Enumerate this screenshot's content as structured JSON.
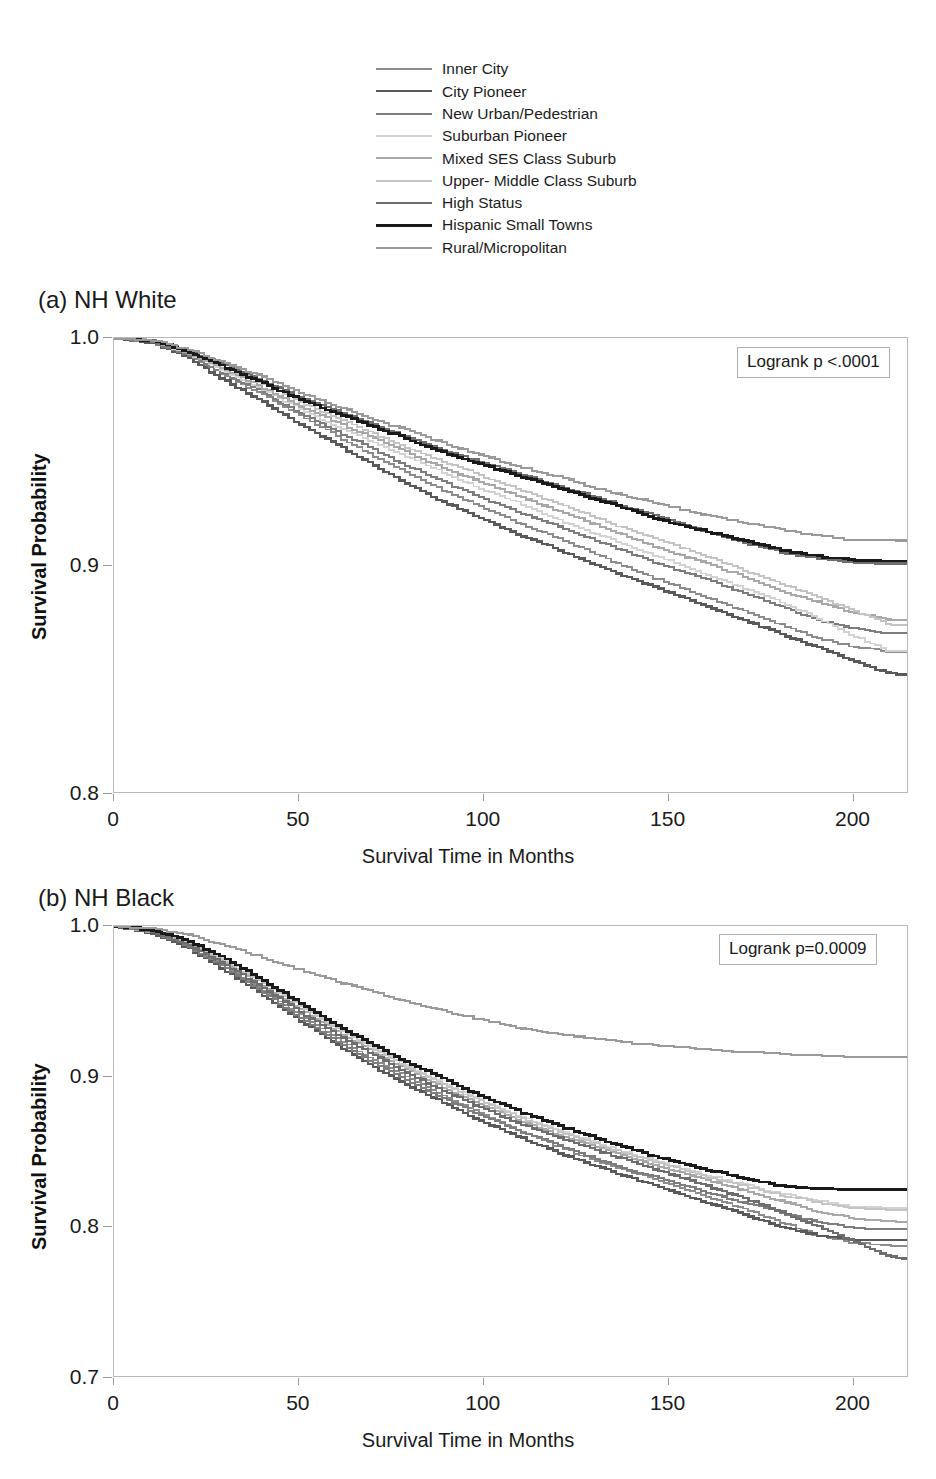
{
  "legend": {
    "position": "top-center",
    "entries": [
      {
        "label": "Inner City",
        "color": "#8c8c8c",
        "width": 2.0
      },
      {
        "label": "City Pioneer",
        "color": "#5a5a5a",
        "width": 2.6
      },
      {
        "label": "New Urban/Pedestrian",
        "color": "#7d7d7d",
        "width": 2.2
      },
      {
        "label": "Suburban Pioneer",
        "color": "#d2d2d2",
        "width": 2.0
      },
      {
        "label": "Mixed SES Class Suburb",
        "color": "#a8a8a8",
        "width": 2.2
      },
      {
        "label": "Upper- Middle Class Suburb",
        "color": "#c4c4c4",
        "width": 2.0
      },
      {
        "label": "High Status",
        "color": "#6e6e6e",
        "width": 2.4
      },
      {
        "label": "Hispanic Small Towns",
        "color": "#1a1a1a",
        "width": 3.0
      },
      {
        "label": "Rural/Micropolitan",
        "color": "#9a9a9a",
        "width": 2.2
      }
    ]
  },
  "panels": [
    {
      "title": "(a) NH White",
      "annotation": "Logrank p <.0001",
      "xlabel": "Survival Time in Months",
      "ylabel": "Survival Probability",
      "yticks": [
        "1.0",
        "0.9",
        "0.8"
      ],
      "xticks": [
        "0",
        "50",
        "100",
        "150",
        "200"
      ]
    },
    {
      "title": "(b) NH Black",
      "annotation": "Logrank p=0.0009",
      "xlabel": "Survival Time in Months",
      "ylabel": "Survival Probability",
      "yticks": [
        "1.0",
        "0.9",
        "0.8",
        "0.7"
      ],
      "xticks": [
        "0",
        "50",
        "100",
        "150",
        "200"
      ]
    }
  ],
  "chart_data": [
    {
      "type": "line",
      "panel": "(a) NH White",
      "title": "(a) NH White",
      "xlabel": "Survival Time in Months",
      "ylabel": "Survival Probability",
      "xlim": [
        0,
        215
      ],
      "ylim": [
        0.8,
        1.0
      ],
      "xticks": [
        0,
        50,
        100,
        150,
        200
      ],
      "yticks": [
        0.8,
        0.9,
        1.0
      ],
      "grid": false,
      "legend_position": "above-figure",
      "annotation": "Logrank p <.0001",
      "x": [
        0,
        10,
        20,
        30,
        40,
        50,
        60,
        70,
        80,
        90,
        100,
        110,
        120,
        130,
        140,
        150,
        160,
        170,
        180,
        190,
        200,
        210,
        215
      ],
      "series": [
        {
          "name": "Inner City",
          "color": "#8c8c8c",
          "values": [
            1.0,
            0.998,
            0.992,
            0.983,
            0.975,
            0.966,
            0.957,
            0.948,
            0.94,
            0.932,
            0.925,
            0.918,
            0.912,
            0.905,
            0.898,
            0.892,
            0.886,
            0.88,
            0.874,
            0.868,
            0.864,
            0.862,
            0.862
          ]
        },
        {
          "name": "City Pioneer",
          "color": "#5a5a5a",
          "values": [
            1.0,
            0.998,
            0.991,
            0.981,
            0.972,
            0.962,
            0.953,
            0.944,
            0.935,
            0.927,
            0.92,
            0.913,
            0.907,
            0.9,
            0.894,
            0.888,
            0.882,
            0.876,
            0.87,
            0.864,
            0.858,
            0.852,
            0.852
          ]
        },
        {
          "name": "New Urban/Pedestrian",
          "color": "#7d7d7d",
          "values": [
            1.0,
            0.998,
            0.992,
            0.984,
            0.976,
            0.967,
            0.959,
            0.951,
            0.943,
            0.936,
            0.929,
            0.923,
            0.917,
            0.911,
            0.905,
            0.899,
            0.894,
            0.888,
            0.882,
            0.876,
            0.872,
            0.87,
            0.87
          ]
        },
        {
          "name": "Suburban Pioneer",
          "color": "#d2d2d2",
          "values": [
            1.0,
            0.999,
            0.993,
            0.985,
            0.977,
            0.969,
            0.961,
            0.954,
            0.947,
            0.94,
            0.933,
            0.927,
            0.92,
            0.914,
            0.908,
            0.902,
            0.896,
            0.89,
            0.884,
            0.877,
            0.869,
            0.862,
            0.862
          ]
        },
        {
          "name": "Mixed SES Class Suburb",
          "color": "#a8a8a8",
          "values": [
            1.0,
            0.999,
            0.993,
            0.986,
            0.978,
            0.97,
            0.963,
            0.956,
            0.949,
            0.942,
            0.936,
            0.93,
            0.924,
            0.918,
            0.912,
            0.906,
            0.901,
            0.895,
            0.889,
            0.884,
            0.879,
            0.876,
            0.876
          ]
        },
        {
          "name": "Upper- Middle Class Suburb",
          "color": "#c4c4c4",
          "values": [
            1.0,
            0.999,
            0.994,
            0.987,
            0.98,
            0.972,
            0.965,
            0.958,
            0.951,
            0.945,
            0.939,
            0.933,
            0.927,
            0.921,
            0.915,
            0.91,
            0.904,
            0.898,
            0.892,
            0.886,
            0.88,
            0.874,
            0.874
          ]
        },
        {
          "name": "High Status",
          "color": "#6e6e6e",
          "values": [
            1.0,
            0.999,
            0.994,
            0.988,
            0.981,
            0.974,
            0.968,
            0.962,
            0.956,
            0.95,
            0.945,
            0.94,
            0.935,
            0.93,
            0.925,
            0.92,
            0.915,
            0.91,
            0.906,
            0.903,
            0.901,
            0.901,
            0.901
          ]
        },
        {
          "name": "Hispanic Small Towns",
          "color": "#1a1a1a",
          "values": [
            1.0,
            0.999,
            0.994,
            0.987,
            0.98,
            0.973,
            0.967,
            0.961,
            0.955,
            0.949,
            0.944,
            0.939,
            0.934,
            0.929,
            0.924,
            0.919,
            0.915,
            0.911,
            0.907,
            0.904,
            0.902,
            0.902,
            0.902
          ]
        },
        {
          "name": "Rural/Micropolitan",
          "color": "#9a9a9a",
          "values": [
            1.0,
            0.999,
            0.995,
            0.989,
            0.983,
            0.976,
            0.97,
            0.964,
            0.959,
            0.953,
            0.948,
            0.943,
            0.939,
            0.934,
            0.93,
            0.926,
            0.922,
            0.919,
            0.916,
            0.913,
            0.911,
            0.911,
            0.911
          ]
        }
      ]
    },
    {
      "type": "line",
      "panel": "(b) NH Black",
      "title": "(b) NH Black",
      "xlabel": "Survival Time in Months",
      "ylabel": "Survival Probability",
      "xlim": [
        0,
        215
      ],
      "ylim": [
        0.7,
        1.0
      ],
      "xticks": [
        0,
        50,
        100,
        150,
        200
      ],
      "yticks": [
        0.7,
        0.8,
        0.9,
        1.0
      ],
      "grid": false,
      "legend_position": "above-figure",
      "annotation": "Logrank p=0.0009",
      "x": [
        0,
        10,
        20,
        30,
        40,
        50,
        60,
        70,
        80,
        90,
        100,
        110,
        120,
        130,
        140,
        150,
        160,
        170,
        180,
        190,
        200,
        210,
        215
      ],
      "series": [
        {
          "name": "Inner City",
          "color": "#8c8c8c",
          "values": [
            1.0,
            0.996,
            0.987,
            0.973,
            0.957,
            0.941,
            0.925,
            0.911,
            0.898,
            0.886,
            0.874,
            0.863,
            0.853,
            0.844,
            0.836,
            0.828,
            0.82,
            0.812,
            0.803,
            0.794,
            0.789,
            0.787,
            0.787
          ]
        },
        {
          "name": "City Pioneer",
          "color": "#5a5a5a",
          "values": [
            1.0,
            0.995,
            0.985,
            0.97,
            0.954,
            0.937,
            0.921,
            0.906,
            0.893,
            0.881,
            0.869,
            0.859,
            0.849,
            0.84,
            0.832,
            0.824,
            0.816,
            0.808,
            0.8,
            0.794,
            0.791,
            0.791,
            0.791
          ]
        },
        {
          "name": "New Urban/Pedestrian",
          "color": "#7d7d7d",
          "values": [
            1.0,
            0.996,
            0.986,
            0.972,
            0.956,
            0.939,
            0.923,
            0.909,
            0.896,
            0.884,
            0.873,
            0.863,
            0.854,
            0.845,
            0.837,
            0.83,
            0.823,
            0.816,
            0.809,
            0.803,
            0.799,
            0.798,
            0.798
          ]
        },
        {
          "name": "Suburban Pioneer",
          "color": "#d2d2d2",
          "values": [
            1.0,
            0.997,
            0.989,
            0.977,
            0.963,
            0.948,
            0.933,
            0.919,
            0.906,
            0.894,
            0.883,
            0.873,
            0.864,
            0.856,
            0.848,
            0.841,
            0.834,
            0.828,
            0.822,
            0.817,
            0.813,
            0.812,
            0.812
          ]
        },
        {
          "name": "Mixed SES Class Suburb",
          "color": "#a8a8a8",
          "values": [
            1.0,
            0.996,
            0.988,
            0.975,
            0.96,
            0.945,
            0.93,
            0.916,
            0.903,
            0.891,
            0.88,
            0.87,
            0.861,
            0.853,
            0.845,
            0.838,
            0.831,
            0.824,
            0.817,
            0.81,
            0.805,
            0.803,
            0.803
          ]
        },
        {
          "name": "Upper- Middle Class Suburb",
          "color": "#c4c4c4",
          "values": [
            1.0,
            0.997,
            0.989,
            0.976,
            0.962,
            0.947,
            0.932,
            0.918,
            0.905,
            0.893,
            0.882,
            0.872,
            0.863,
            0.855,
            0.847,
            0.84,
            0.833,
            0.827,
            0.821,
            0.816,
            0.812,
            0.811,
            0.811
          ]
        },
        {
          "name": "High Status",
          "color": "#6e6e6e",
          "values": [
            1.0,
            0.996,
            0.987,
            0.974,
            0.959,
            0.943,
            0.928,
            0.914,
            0.901,
            0.889,
            0.878,
            0.868,
            0.859,
            0.851,
            0.843,
            0.835,
            0.827,
            0.819,
            0.81,
            0.8,
            0.79,
            0.78,
            0.778
          ]
        },
        {
          "name": "Hispanic Small Towns",
          "color": "#1a1a1a",
          "values": [
            1.0,
            0.997,
            0.99,
            0.978,
            0.964,
            0.949,
            0.934,
            0.921,
            0.908,
            0.897,
            0.886,
            0.876,
            0.867,
            0.859,
            0.851,
            0.844,
            0.838,
            0.832,
            0.827,
            0.825,
            0.825,
            0.825,
            0.825
          ]
        },
        {
          "name": "Rural/Micropolitan",
          "color": "#9a9a9a",
          "values": [
            1.0,
            0.998,
            0.994,
            0.987,
            0.979,
            0.971,
            0.963,
            0.956,
            0.949,
            0.943,
            0.937,
            0.932,
            0.928,
            0.925,
            0.922,
            0.92,
            0.918,
            0.916,
            0.915,
            0.914,
            0.913,
            0.913,
            0.913
          ]
        }
      ]
    }
  ]
}
